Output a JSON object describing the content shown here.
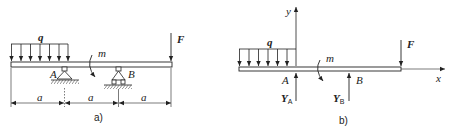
{
  "figure_a": {
    "caption": "a)",
    "load_q": "q",
    "moment_m": "m",
    "force_F": "F",
    "support_A": "A",
    "support_B": "B",
    "dimensions": [
      "a",
      "a",
      "a"
    ]
  },
  "figure_b": {
    "caption": "b)",
    "load_q": "q",
    "moment_m": "m",
    "force_F": "F",
    "point_A": "A",
    "point_B": "B",
    "axis_x": "x",
    "axis_y": "y",
    "reaction_A": {
      "symbol": "Y",
      "sub": "A"
    },
    "reaction_B": {
      "symbol": "Y",
      "sub": "B"
    }
  },
  "colors": {
    "line": "#222222",
    "background": "#ffffff"
  }
}
